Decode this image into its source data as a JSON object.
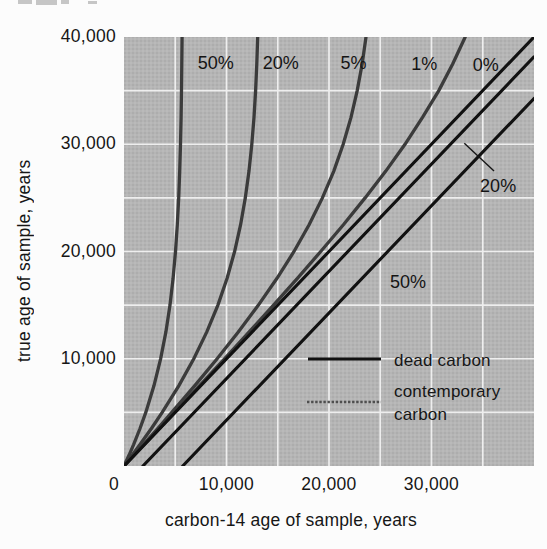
{
  "page": {
    "background": "#fcfcfc"
  },
  "chart_data": {
    "type": "line",
    "title": "",
    "xlabel": "carbon-14 age of sample, years",
    "ylabel": "true age of sample, years",
    "xlim": [
      0,
      40000
    ],
    "ylim": [
      0,
      40000
    ],
    "grid": {
      "show": true,
      "interval": 5000,
      "color": "#f2f2f2"
    },
    "plot_background": "#b5b5b5",
    "x_ticks": [
      {
        "value": 0,
        "label": "0"
      },
      {
        "value": 10000,
        "label": "10,000"
      },
      {
        "value": 20000,
        "label": "20,000"
      },
      {
        "value": 30000,
        "label": "30,000"
      }
    ],
    "y_ticks": [
      {
        "value": 10000,
        "label": "10,000"
      },
      {
        "value": 20000,
        "label": "20,000"
      },
      {
        "value": 30000,
        "label": "30,000"
      },
      {
        "value": 40000,
        "label": "40,000"
      }
    ],
    "series": [
      {
        "id": "contemporary-50",
        "family": "contemporary",
        "label": "50%",
        "color": "#3b3b3b",
        "width": 3.3,
        "points": [
          [
            0,
            0
          ],
          [
            485,
            1000
          ],
          [
            940,
            2000
          ],
          [
            1565,
            3500
          ],
          [
            2128,
            5000
          ],
          [
            2927,
            7500
          ],
          [
            3572,
            10000
          ],
          [
            4083,
            12500
          ],
          [
            4483,
            15000
          ],
          [
            4790,
            17500
          ],
          [
            5026,
            20000
          ],
          [
            5204,
            22500
          ],
          [
            5339,
            25000
          ],
          [
            5439,
            27500
          ],
          [
            5514,
            30000
          ],
          [
            5570,
            32500
          ],
          [
            5612,
            35000
          ],
          [
            5642,
            37500
          ],
          [
            5666,
            40000
          ]
        ]
      },
      {
        "id": "contemporary-20",
        "family": "contemporary",
        "label": "20%",
        "color": "#3b3b3b",
        "width": 3.3,
        "points": [
          [
            0,
            0
          ],
          [
            790,
            1000
          ],
          [
            1560,
            2000
          ],
          [
            2670,
            3500
          ],
          [
            3729,
            5000
          ],
          [
            5359,
            7500
          ],
          [
            6813,
            10000
          ],
          [
            8079,
            12500
          ],
          [
            9157,
            15000
          ],
          [
            10055,
            17500
          ],
          [
            10788,
            20000
          ],
          [
            11375,
            22500
          ],
          [
            11837,
            25000
          ],
          [
            12196,
            27500
          ],
          [
            12471,
            30000
          ],
          [
            12681,
            32500
          ],
          [
            12839,
            35000
          ],
          [
            12959,
            37500
          ],
          [
            13048,
            40000
          ]
        ]
      },
      {
        "id": "contemporary-5",
        "family": "contemporary",
        "label": "5%",
        "color": "#3b3b3b",
        "width": 3.3,
        "points": [
          [
            0,
            0
          ],
          [
            947,
            1000
          ],
          [
            1888,
            2000
          ],
          [
            3283,
            3500
          ],
          [
            4663,
            5000
          ],
          [
            6910,
            7500
          ],
          [
            9081,
            10000
          ],
          [
            11155,
            12500
          ],
          [
            13111,
            15000
          ],
          [
            14925,
            17500
          ],
          [
            16583,
            20000
          ],
          [
            18063,
            22500
          ],
          [
            19358,
            25000
          ],
          [
            20467,
            27500
          ],
          [
            21390,
            30000
          ],
          [
            22149,
            32500
          ],
          [
            22755,
            35000
          ],
          [
            23236,
            37500
          ],
          [
            23607,
            40000
          ]
        ]
      },
      {
        "id": "contemporary-1",
        "family": "contemporary",
        "label": "1%",
        "color": "#3b3b3b",
        "width": 3.3,
        "points": [
          [
            0,
            0
          ],
          [
            989,
            1000
          ],
          [
            1978,
            2000
          ],
          [
            3454,
            3500
          ],
          [
            4931,
            5000
          ],
          [
            7378,
            7500
          ],
          [
            9808,
            10000
          ],
          [
            12214,
            12500
          ],
          [
            14588,
            15000
          ],
          [
            16916,
            17500
          ],
          [
            19194,
            20000
          ],
          [
            21402,
            22500
          ],
          [
            23521,
            25000
          ],
          [
            25537,
            27500
          ],
          [
            27416,
            30000
          ],
          [
            29123,
            32500
          ],
          [
            30712,
            35000
          ],
          [
            32076,
            37500
          ],
          [
            33285,
            40000
          ]
        ]
      },
      {
        "id": "reference-0",
        "family": "reference",
        "label": "0%",
        "color": "#111111",
        "width": 3.1,
        "points": [
          [
            0,
            0
          ],
          [
            40000,
            40000
          ]
        ]
      },
      {
        "id": "dead-20",
        "family": "dead",
        "label": "20%",
        "color": "#111111",
        "width": 3.1,
        "points": [
          [
            1845,
            0
          ],
          [
            40000,
            38155
          ]
        ]
      },
      {
        "id": "dead-50",
        "family": "dead",
        "label": "50%",
        "color": "#111111",
        "width": 3.1,
        "points": [
          [
            5730,
            0
          ],
          [
            40000,
            34270
          ]
        ]
      }
    ],
    "curve_labels": [
      {
        "series": "contemporary-50",
        "text": "50%",
        "x": 8950,
        "y": 37550
      },
      {
        "series": "contemporary-20",
        "text": "20%",
        "x": 15300,
        "y": 37550
      },
      {
        "series": "contemporary-5",
        "text": "5%",
        "x": 22400,
        "y": 37550
      },
      {
        "series": "contemporary-1",
        "text": "1%",
        "x": 29300,
        "y": 37450
      },
      {
        "series": "reference-0",
        "text": "0%",
        "x": 35300,
        "y": 37350
      },
      {
        "series": "dead-20",
        "text": "20%",
        "x": 36500,
        "y": 26100,
        "leader": {
          "x1": 33200,
          "y1": 30100,
          "x2": 36100,
          "y2": 27500
        }
      },
      {
        "series": "dead-50",
        "text": "50%",
        "x": 27700,
        "y": 17200
      }
    ],
    "legend": {
      "position": "lower-right-inside",
      "items": [
        {
          "style": "solid-black",
          "color": "#111111",
          "label_lines": [
            "dead carbon"
          ]
        },
        {
          "style": "halftone-gray",
          "color": "#4e4e4e",
          "label_lines": [
            "contemporary",
            "carbon"
          ]
        }
      ]
    }
  }
}
